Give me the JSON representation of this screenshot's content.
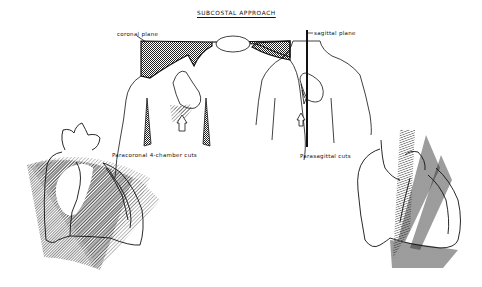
{
  "figure": {
    "title": "SUBCOSTAL APPROACH",
    "labels": {
      "coronal_plane": "coronal plane",
      "sagittal_plane": "sagittal plane",
      "paracoronal_cuts": "Paracoronal 4-chamber cuts",
      "parasagittal_cuts": "Parasagittal cuts"
    },
    "panels": [
      {
        "name": "torso-coronal",
        "description": "Front torso with shaded coronal plane across shoulders, heart outline, and transducer arrow below"
      },
      {
        "name": "torso-sagittal",
        "description": "Front torso with vertical sagittal plane line through heart and transducer arrow"
      },
      {
        "name": "heart-paracoronal",
        "description": "Heart outline overlaid with fan of hatched paracoronal 4-chamber imaging planes"
      },
      {
        "name": "heart-parasagittal",
        "description": "Heart outline overlaid with hatched parasagittal imaging planes"
      }
    ],
    "colors": {
      "ink": "#111111",
      "background": "#ffffff"
    }
  }
}
